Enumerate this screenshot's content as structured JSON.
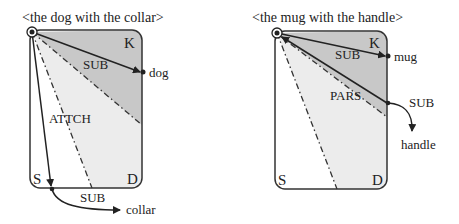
{
  "diagrams": [
    {
      "title": "<the dog with the collar>",
      "corners": {
        "top_right": "K",
        "bottom_left": "S",
        "bottom_right": "D"
      },
      "arrows": [
        {
          "label": "SUB",
          "target": "dog"
        },
        {
          "label": "ATTCH",
          "target": ""
        },
        {
          "label": "SUB",
          "target": "collar"
        }
      ]
    },
    {
      "title": "<the mug with the handle>",
      "corners": {
        "top_right": "K",
        "bottom_left": "S",
        "bottom_right": "D"
      },
      "arrows": [
        {
          "label": "SUB",
          "target": "mug"
        },
        {
          "label": "PARS",
          "target": ""
        },
        {
          "label": "SUB",
          "target": "handle"
        }
      ]
    }
  ],
  "colors": {
    "region_dark": "#c8c8c8",
    "region_light": "#ececec",
    "stroke": "#333333",
    "text": "#222222"
  }
}
